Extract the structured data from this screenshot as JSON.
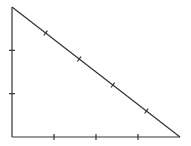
{
  "diagram": {
    "type": "right-triangle",
    "stroke_color": "#333333",
    "background": "#ffffff",
    "vertices": {
      "top": [
        12,
        7
      ],
      "bottom_left": [
        12,
        137
      ],
      "bottom_right": [
        180,
        137
      ]
    },
    "sides": {
      "vertical": {
        "segments": 3,
        "tick_marks": 2
      },
      "horizontal": {
        "segments": 4,
        "tick_marks": 3
      },
      "hypotenuse": {
        "segments": 5,
        "tick_marks": 4
      }
    }
  }
}
